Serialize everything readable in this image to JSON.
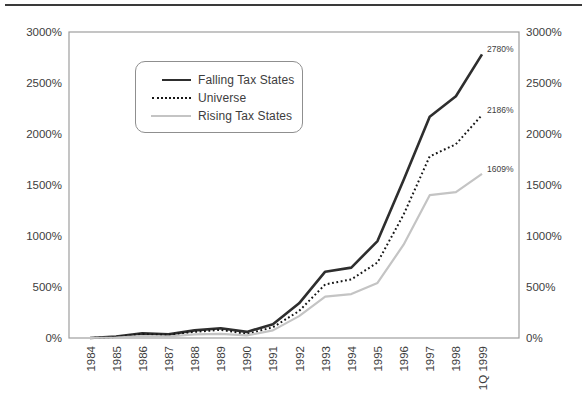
{
  "chart_data": {
    "type": "line",
    "title": "",
    "categories": [
      "1984",
      "1985",
      "1986",
      "1987",
      "1988",
      "1989",
      "1990",
      "1991",
      "1992",
      "1993",
      "1994",
      "1995",
      "1996",
      "1997",
      "1998",
      "1Q 1999"
    ],
    "series": [
      {
        "name": "Falling Tax States",
        "line_style": "solid",
        "color": "#2e2e2e",
        "stroke_width": 2.6,
        "end_label": "2780%",
        "values": [
          0,
          15,
          45,
          35,
          75,
          95,
          60,
          135,
          340,
          650,
          690,
          950,
          1550,
          2170,
          2370,
          2780
        ]
      },
      {
        "name": "Universe",
        "line_style": "dotted",
        "color": "#161616",
        "stroke_width": 2,
        "end_label": "2186%",
        "values": [
          0,
          10,
          38,
          30,
          60,
          80,
          40,
          105,
          265,
          525,
          575,
          740,
          1210,
          1780,
          1900,
          2186
        ]
      },
      {
        "name": "Rising Tax States",
        "line_style": "solid",
        "color": "#c4c4c4",
        "stroke_width": 2.2,
        "end_label": "1609%",
        "values": [
          0,
          5,
          20,
          15,
          35,
          40,
          25,
          75,
          215,
          405,
          430,
          540,
          915,
          1400,
          1430,
          1609
        ]
      }
    ],
    "y_axis": {
      "min": 0,
      "max": 3000,
      "tick_step": 500,
      "tick_labels": [
        "0%",
        "500%",
        "1000%",
        "1500%",
        "2000%",
        "2500%",
        "3000%"
      ],
      "sides": [
        "left",
        "right"
      ]
    },
    "x_axis": {
      "label_rotation": -90
    },
    "legend": {
      "position": "inset-top-left"
    },
    "grid": false,
    "plot_border_color": "#9e9e9e",
    "text_color": "#3d3d3d",
    "top_rule_color": "#3a3a3a"
  }
}
